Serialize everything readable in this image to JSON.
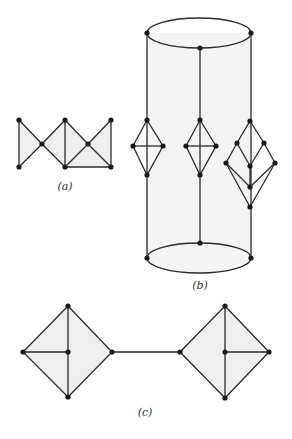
{
  "figure": {
    "panels": [
      {
        "id": "a",
        "label": "(a)",
        "description": "Chain of triangles forming bowtie-like strip with 8 vertices"
      },
      {
        "id": "b",
        "label": "(b)",
        "description": "Cylinder with top and bottom elliptical rims, three vertical paths each containing a diamond-like subgraph"
      },
      {
        "id": "c",
        "label": "(c)",
        "description": "Two wheel-like diamonds (each with a center vertex) joined by a single edge"
      }
    ]
  },
  "labels": {
    "a": "(a)",
    "b": "(b)",
    "c": "(c)"
  },
  "colors": {
    "edge": "#2b2b2b",
    "node": "#1a1a1a",
    "face": "#efefef"
  }
}
